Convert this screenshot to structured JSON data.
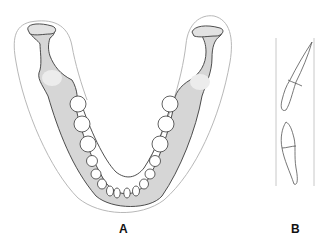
{
  "figure": {
    "panels": [
      {
        "id": "A",
        "label": "A",
        "description": "Mandible occlusal view with dental arch"
      },
      {
        "id": "B",
        "label": "B",
        "description": "Lateral view of opposing incisors between reference lines"
      }
    ],
    "colors": {
      "bone": "#d6d6d6",
      "bone_highlight": "#ececec",
      "outline": "#3a3a3a",
      "soft_tissue_outline": "#b8b8b8",
      "tooth_fill": "#ffffff",
      "reference_line": "#c8c8c8"
    }
  }
}
